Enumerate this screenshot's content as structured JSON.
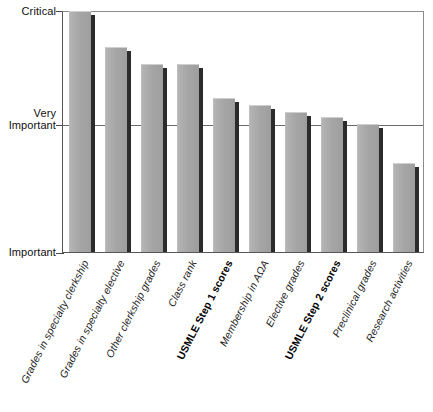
{
  "chart_data": {
    "type": "bar",
    "title": "",
    "subtitle": "",
    "xlabel": "",
    "ylabel": "",
    "orientation": "vertical",
    "grid": true,
    "legend": null,
    "legend_position": "none",
    "bar_color": "#a9a9a9",
    "bar_shadow_color": "#2b2b2b",
    "axis_color": "#555555",
    "gridline_color": "#6b6b6b",
    "background": "#ffffff",
    "y_axis": {
      "type": "ordinal-scale",
      "tick_labels": [
        "Critical",
        "Very\nImportant",
        "Important"
      ],
      "tick_values": [
        1.0,
        0.5,
        0.0
      ],
      "ylim": [
        0.0,
        1.0
      ],
      "gridlines_at": [
        1.0,
        0.5
      ]
    },
    "categories": [
      "Grades in specialty clerkship",
      "Grades in specialty elective",
      "Other clerkship grades",
      "Class rank",
      "USMLE Step 1 scores",
      "Membership in AΩA",
      "Elective grades",
      "USMLE Step 2 scores",
      "Preclinical grades",
      "Research activities"
    ],
    "category_emphasis": [
      false,
      false,
      false,
      false,
      true,
      false,
      false,
      true,
      false,
      false
    ],
    "values": [
      1.0,
      0.85,
      0.78,
      0.78,
      0.64,
      0.61,
      0.58,
      0.56,
      0.53,
      0.37
    ],
    "bars": [
      {
        "label": "Grades in specialty clerkship",
        "value": 1.0,
        "bold": false
      },
      {
        "label": "Grades in specialty elective",
        "value": 0.85,
        "bold": false
      },
      {
        "label": "Other clerkship grades",
        "value": 0.78,
        "bold": false
      },
      {
        "label": "Class rank",
        "value": 0.78,
        "bold": false
      },
      {
        "label": "USMLE Step 1 scores",
        "value": 0.64,
        "bold": true
      },
      {
        "label": "Membership in AΩA",
        "value": 0.61,
        "bold": false
      },
      {
        "label": "Elective grades",
        "value": 0.58,
        "bold": false
      },
      {
        "label": "USMLE Step 2 scores",
        "value": 0.56,
        "bold": true
      },
      {
        "label": "Preclinical grades",
        "value": 0.53,
        "bold": false
      },
      {
        "label": "Research activities",
        "value": 0.37,
        "bold": false
      }
    ]
  },
  "caption": ""
}
